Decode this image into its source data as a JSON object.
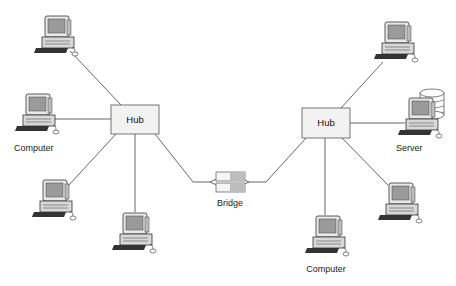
{
  "diagram": {
    "type": "network-topology",
    "nodes": {
      "hub_left": {
        "label": "Hub",
        "x": 111,
        "y": 105,
        "w": 48,
        "h": 29
      },
      "hub_right": {
        "label": "Hub",
        "x": 302,
        "y": 108,
        "w": 48,
        "h": 30
      },
      "bridge": {
        "label": "Bridge",
        "x": 214,
        "y": 176,
        "w": 30,
        "h": 18
      },
      "computers": [
        {
          "id": "c1",
          "label": "",
          "x": 38,
          "y": 14
        },
        {
          "id": "c2",
          "label": "Computer",
          "x": 18,
          "y": 90
        },
        {
          "id": "c3",
          "label": "",
          "x": 35,
          "y": 176
        },
        {
          "id": "c4",
          "label": "",
          "x": 115,
          "y": 211
        },
        {
          "id": "c5",
          "label": "",
          "x": 378,
          "y": 20
        },
        {
          "id": "c6",
          "label": "Computer",
          "x": 310,
          "y": 215
        },
        {
          "id": "c7",
          "label": "",
          "x": 383,
          "y": 182
        }
      ],
      "server": {
        "label": "Server",
        "x": 403,
        "y": 95
      }
    },
    "edges": [
      {
        "from": "c1",
        "to": "hub_left"
      },
      {
        "from": "c2",
        "to": "hub_left"
      },
      {
        "from": "c3",
        "to": "hub_left"
      },
      {
        "from": "c4",
        "to": "hub_left"
      },
      {
        "from": "hub_left",
        "to": "bridge"
      },
      {
        "from": "bridge",
        "to": "hub_right"
      },
      {
        "from": "c5",
        "to": "hub_right"
      },
      {
        "from": "server",
        "to": "hub_right"
      },
      {
        "from": "c6",
        "to": "hub_right"
      },
      {
        "from": "c7",
        "to": "hub_right"
      }
    ],
    "colors": {
      "line": "#555555",
      "hub_fill": "#f2f2f2",
      "hub_stroke": "#666666",
      "screen": "#9a9a9a"
    }
  }
}
